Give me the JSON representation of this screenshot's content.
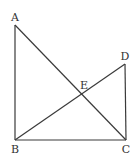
{
  "diagram": {
    "type": "geometry",
    "stroke_color": "#3a3a3a",
    "label_color": "#333333",
    "points": {
      "A": {
        "label": "A",
        "x": 15,
        "y": 25,
        "label_x": 15,
        "label_y": 21
      },
      "B": {
        "label": "B",
        "x": 15,
        "y": 140,
        "label_x": 15,
        "label_y": 153
      },
      "C": {
        "label": "C",
        "x": 126,
        "y": 140,
        "label_x": 126,
        "label_y": 153
      },
      "D": {
        "label": "D",
        "x": 125,
        "y": 64,
        "label_x": 125,
        "label_y": 60
      },
      "E": {
        "label": "E",
        "x": 82,
        "y": 94,
        "label_x": 84,
        "label_y": 89
      }
    },
    "segments": [
      [
        "A",
        "B"
      ],
      [
        "B",
        "C"
      ],
      [
        "A",
        "C"
      ],
      [
        "B",
        "D"
      ],
      [
        "D",
        "C"
      ]
    ]
  }
}
